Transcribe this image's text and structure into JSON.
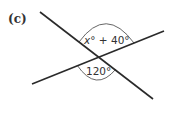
{
  "diagram": {
    "part_label": "(c)",
    "lines": [
      {
        "name": "line-1",
        "x1": 40,
        "y1": 12,
        "x2": 153,
        "y2": 99
      },
      {
        "name": "line-2",
        "x1": 32,
        "y1": 84,
        "x2": 164,
        "y2": 31
      }
    ],
    "intersection": {
      "x": 98.7,
      "y": 57.2
    },
    "angles": {
      "top": {
        "variable": "x",
        "degree_symbol": "°",
        "plus": " + ",
        "constant": "40°"
      },
      "bottom": {
        "value": "120°"
      }
    },
    "colors": {
      "line": "#2a2a2a",
      "arc": "#555555",
      "text": "#333333",
      "background": "#ffffff"
    }
  }
}
